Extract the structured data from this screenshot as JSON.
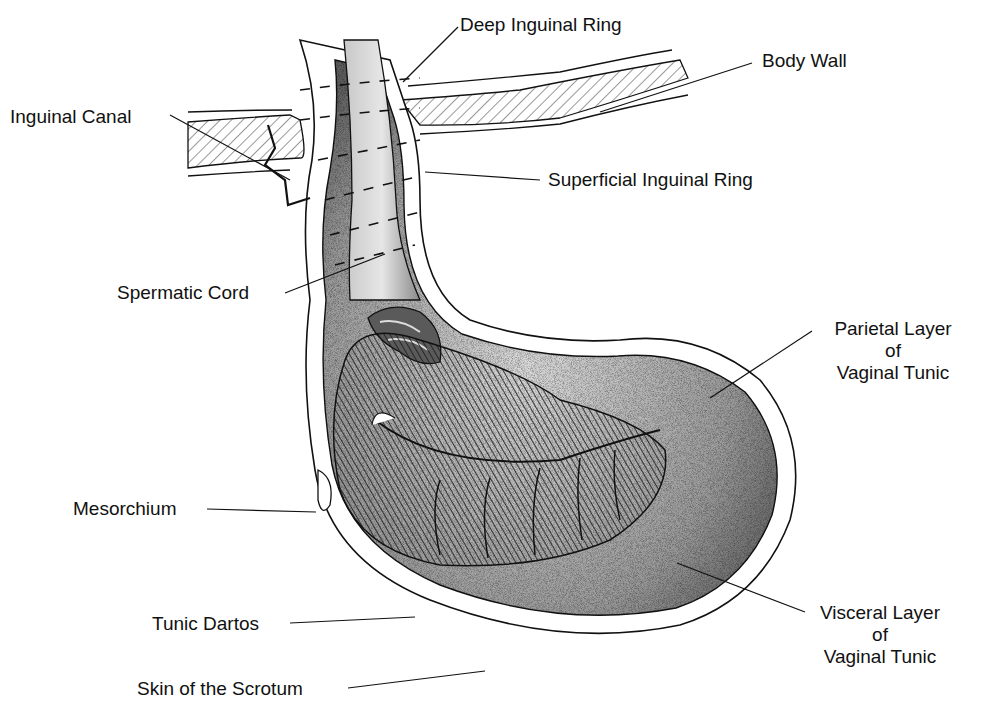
{
  "diagram": {
    "type": "anatomical-illustration",
    "colors": {
      "ink": "#111111",
      "background": "#ffffff",
      "stipple_dark": "#555555",
      "stipple_light": "#bdbdbd",
      "hatch": "#333333"
    },
    "labels": {
      "deep_inguinal_ring": "Deep Inguinal Ring",
      "body_wall": "Body Wall",
      "inguinal_canal": "Inguinal Canal",
      "superficial_inguinal_ring": "Superficial Inguinal Ring",
      "spermatic_cord": "Spermatic Cord",
      "parietal_layer": {
        "line1": "Parietal Layer",
        "line2": "of",
        "line3": "Vaginal Tunic"
      },
      "mesorchium": "Mesorchium",
      "tunic_dartos": "Tunic Dartos",
      "visceral_layer": {
        "line1": "Visceral Layer",
        "line2": "of",
        "line3": "Vaginal Tunic"
      },
      "skin_of_scrotum": "Skin of the Scrotum"
    }
  }
}
